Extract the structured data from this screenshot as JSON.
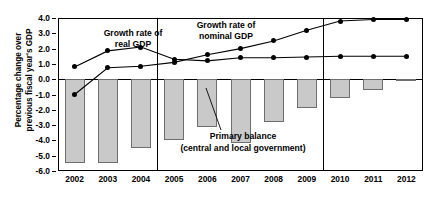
{
  "chart_data": {
    "type": "bar",
    "title": "",
    "xlabel": "",
    "ylabel": "Percentage change over previous fiscal year's GDP",
    "ylim": [
      -6.0,
      4.0
    ],
    "ytick_labels": [
      "4.0",
      "3.0",
      "2.0",
      "1.0",
      "0.0",
      "-1.0",
      "-2.0",
      "-3.0",
      "-4.0",
      "-5.0",
      "-6.0"
    ],
    "ytick_values": [
      4.0,
      3.0,
      2.0,
      1.0,
      0.0,
      -1.0,
      -2.0,
      -3.0,
      -4.0,
      -5.0,
      -6.0
    ],
    "categories": [
      "2002",
      "2003",
      "2004",
      "2005",
      "2006",
      "2007",
      "2008",
      "2009",
      "2010",
      "2011",
      "2012"
    ],
    "grid": false,
    "legend_position": "inline-annotations",
    "series": [
      {
        "name": "Primary balance (central and local government)",
        "type": "bar",
        "values": [
          -5.5,
          -5.5,
          -4.5,
          -4.0,
          -3.1,
          -4.2,
          -2.8,
          -1.9,
          -1.2,
          -0.7,
          -0.15
        ]
      },
      {
        "name": "Growth rate of real GDP",
        "type": "line",
        "values": [
          0.8,
          1.85,
          2.1,
          1.3,
          1.2,
          1.4,
          1.4,
          1.45,
          1.5,
          1.5,
          1.5
        ]
      },
      {
        "name": "Growth rate of nominal GDP",
        "type": "line",
        "values": [
          -1.0,
          0.75,
          0.85,
          1.1,
          1.6,
          2.0,
          2.5,
          3.2,
          3.8,
          3.9,
          3.9
        ]
      }
    ],
    "annotations": [
      {
        "name": "real-gdp-annotation",
        "lines": [
          "Growth rate of",
          "real GDP"
        ]
      },
      {
        "name": "nominal-gdp-annotation",
        "lines": [
          "Growth rate of",
          "nominal GDP"
        ]
      },
      {
        "name": "primary-balance-annotation",
        "lines": [
          "Primary balance",
          "(central and local government)"
        ]
      }
    ],
    "panel_dividers": [
      "2004|2005",
      "2009|2010"
    ],
    "colors": {
      "bar_fill": "#c9c9c9",
      "bar_edge": "#6e6e6e",
      "line": "#000000",
      "axis": "#000000",
      "background": "#ffffff"
    }
  }
}
